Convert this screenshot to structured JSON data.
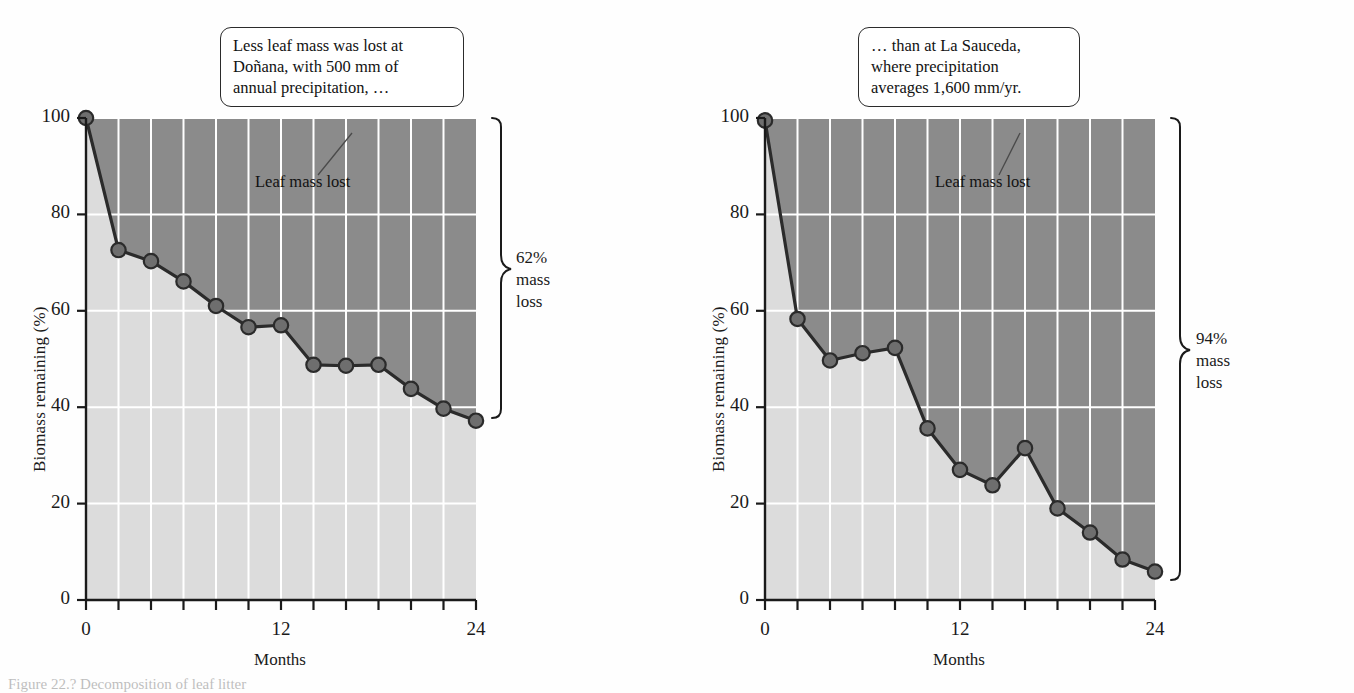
{
  "figure": {
    "caption": "Figure 22.?  Decomposition of leaf litter",
    "colors": {
      "mass_lost_fill": "#8b8b8b",
      "biomass_fill": "#dcdcdc",
      "line": "#2b2b2b",
      "marker": "#6e6e6e",
      "grid": "#ffffff",
      "axis": "#1a1a1a",
      "callout_border": "#2b2b2b"
    }
  },
  "panels": [
    {
      "id": "donana",
      "callout": {
        "lines": [
          "Less leaf mass was lost at",
          "Doñana, with 500 mm of",
          "annual precipitation, …"
        ]
      },
      "inplot_label": "Leaf mass lost",
      "brace_note": {
        "percent": "62%",
        "line2": "mass",
        "line3": "loss"
      },
      "chart_data": {
        "type": "area",
        "title": "Doñana",
        "xlabel": "Months",
        "ylabel": "Biomass remaining (%)",
        "xlim": [
          0,
          24
        ],
        "ylim": [
          0,
          100
        ],
        "xticks": [
          0,
          2,
          4,
          6,
          8,
          10,
          12,
          14,
          16,
          18,
          20,
          22,
          24
        ],
        "xtick_labels": [
          "0",
          "",
          "",
          "",
          "",
          "",
          "12",
          "",
          "",
          "",
          "",
          "",
          "24"
        ],
        "yticks": [
          0,
          20,
          40,
          60,
          80,
          100
        ],
        "ytick_labels": [
          "0",
          "20",
          "40",
          "60",
          "80",
          "100"
        ],
        "grid": true,
        "legend": "none",
        "series": [
          {
            "name": "Biomass remaining",
            "x": [
              0,
              2,
              4,
              6,
              8,
              10,
              12,
              14,
              16,
              18,
              20,
              22,
              24
            ],
            "values": [
              100,
              72.6,
              70.3,
              66.1,
              61.0,
              56.6,
              57.0,
              48.8,
              48.6,
              48.8,
              43.8,
              39.7,
              37.2
            ]
          }
        ],
        "annotations": [
          "Leaf mass lost",
          "62% mass loss"
        ]
      }
    },
    {
      "id": "la-sauceda",
      "callout": {
        "lines": [
          "… than at La Sauceda,",
          "where precipitation",
          "averages 1,600 mm/yr."
        ]
      },
      "inplot_label": "Leaf mass lost",
      "brace_note": {
        "percent": "94%",
        "line2": "mass",
        "line3": "loss"
      },
      "chart_data": {
        "type": "area",
        "title": "La Sauceda",
        "xlabel": "Months",
        "ylabel": "Biomass remaining (%)",
        "xlim": [
          0,
          24
        ],
        "ylim": [
          0,
          100
        ],
        "xticks": [
          0,
          2,
          4,
          6,
          8,
          10,
          12,
          14,
          16,
          18,
          20,
          22,
          24
        ],
        "xtick_labels": [
          "0",
          "",
          "",
          "",
          "",
          "",
          "12",
          "",
          "",
          "",
          "",
          "",
          "24"
        ],
        "yticks": [
          0,
          20,
          40,
          60,
          80,
          100
        ],
        "ytick_labels": [
          "0",
          "20",
          "40",
          "60",
          "80",
          "100"
        ],
        "grid": true,
        "legend": "none",
        "series": [
          {
            "name": "Biomass remaining",
            "x": [
              0,
              2,
              4,
              6,
              8,
              10,
              12,
              14,
              16,
              18,
              20,
              22,
              24
            ],
            "values": [
              99.5,
              58.3,
              49.7,
              51.2,
              52.3,
              35.6,
              27.0,
              23.8,
              31.5,
              19.0,
              14.0,
              8.4,
              5.9
            ]
          }
        ],
        "annotations": [
          "Leaf mass lost",
          "94% mass loss"
        ]
      }
    }
  ]
}
